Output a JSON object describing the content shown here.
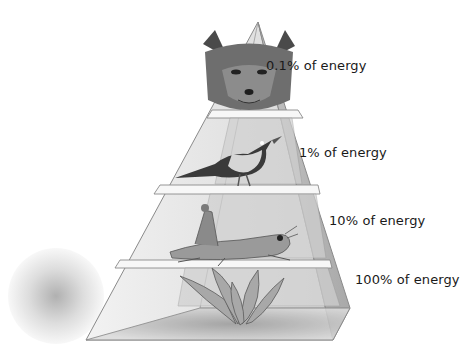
{
  "levels": [
    {
      "organism": "fox",
      "trophic_level": "tertiary consumer",
      "label": "0.1% of energy"
    },
    {
      "organism": "bird",
      "trophic_level": "secondary consumer",
      "label": "1% of energy"
    },
    {
      "organism": "grasshopper",
      "trophic_level": "primary consumer",
      "label": "10% of energy"
    },
    {
      "organism": "plant",
      "trophic_level": "producer",
      "label": "100% of energy"
    }
  ],
  "colors": {
    "glass_face": "#e6e6e6",
    "glass_side": "#bdbdbd",
    "edge": "#8a8a8a",
    "text": "#1a1a1a"
  }
}
